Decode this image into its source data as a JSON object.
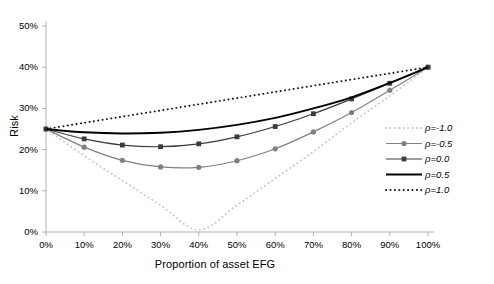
{
  "chart_data": {
    "type": "line",
    "title": "",
    "xlabel": "Proportion of asset EFG",
    "ylabel": "Risk",
    "xlim": [
      0,
      100
    ],
    "ylim": [
      0,
      50
    ],
    "grid": false,
    "legend_position": "right",
    "x": [
      0,
      10,
      20,
      30,
      40,
      50,
      60,
      70,
      80,
      90,
      100
    ],
    "xticks": [
      "0%",
      "10%",
      "20%",
      "30%",
      "40%",
      "50%",
      "60%",
      "70%",
      "80%",
      "90%",
      "100%"
    ],
    "yticks": [
      "0%",
      "10%",
      "20%",
      "30%",
      "40%",
      "50%"
    ],
    "series": [
      {
        "name": "ρ=-1.0",
        "style": "dotted",
        "marker": "none",
        "color": "#c8c8c8",
        "values": [
          25.0,
          18.5,
          12.5,
          6.5,
          0.5,
          6.5,
          13.0,
          19.5,
          26.5,
          33.0,
          40.0
        ]
      },
      {
        "name": "ρ=-0.5",
        "style": "solid",
        "marker": "circle",
        "color": "#808080",
        "values": [
          25.0,
          20.6,
          17.4,
          15.8,
          15.7,
          17.3,
          20.2,
          24.3,
          29.0,
          34.4,
          40.0
        ]
      },
      {
        "name": "ρ=0.0",
        "style": "solid",
        "marker": "square",
        "color": "#3c3c3c",
        "values": [
          25.0,
          22.6,
          21.1,
          20.7,
          21.4,
          23.1,
          25.6,
          28.7,
          32.3,
          36.1,
          40.0
        ]
      },
      {
        "name": "ρ=0.5",
        "style": "solid",
        "marker": "none",
        "color": "#000000",
        "values": [
          25.0,
          24.2,
          23.9,
          24.1,
          24.8,
          26.0,
          27.7,
          30.0,
          32.7,
          36.2,
          40.0
        ]
      },
      {
        "name": "ρ=1.0",
        "style": "dotted",
        "marker": "none",
        "color": "#1a1a1a",
        "values": [
          25.0,
          26.5,
          28.0,
          29.5,
          31.0,
          32.5,
          34.0,
          35.5,
          37.0,
          38.5,
          40.0
        ]
      }
    ],
    "legend_entries": [
      {
        "label": "ρ=-1.0",
        "style": "dotted",
        "marker": "none",
        "color": "#c8c8c8"
      },
      {
        "label": "ρ=-0.5",
        "style": "solid",
        "marker": "circle",
        "color": "#808080"
      },
      {
        "label": "ρ=0.0",
        "style": "solid",
        "marker": "square",
        "color": "#3c3c3c"
      },
      {
        "label": "ρ=0.5",
        "style": "solid",
        "marker": "none",
        "color": "#000000"
      },
      {
        "label": "ρ=1.0",
        "style": "dotted",
        "marker": "none",
        "color": "#1a1a1a"
      }
    ],
    "axis_color": "#b0b0b0"
  }
}
